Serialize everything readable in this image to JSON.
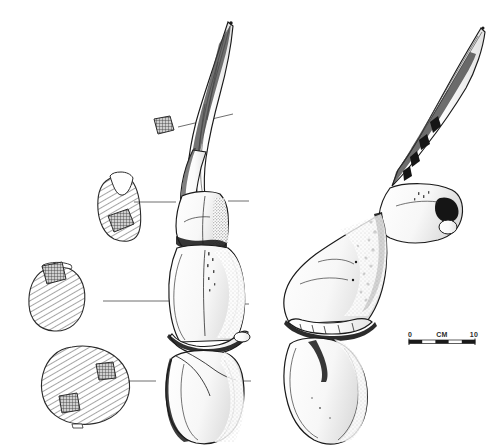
{
  "figure": {
    "type": "scientific-line-drawing",
    "background_color": "#ffffff",
    "ink_color": "#1a1a1a",
    "hatch_color": "#555555",
    "shade_color": "#888888"
  },
  "scale_bar": {
    "name": "scale-bar",
    "left_label": "0",
    "unit_label": "CM",
    "right_label": "10",
    "segments": 5,
    "bar_color": "#1a1a1a",
    "x": 409,
    "y": 339,
    "width": 66
  },
  "views": [
    {
      "id": "dorsal-view",
      "label": "dorsal view of cranium with horn core",
      "position": "center-left"
    },
    {
      "id": "lateral-view",
      "label": "lateral view of cranium with horn core",
      "position": "right"
    }
  ],
  "cross_sections": [
    {
      "id": "section-a",
      "label": "horn core distal cross-section",
      "shape": "small-square",
      "inclusions": 1,
      "leader_to": "upper horn core"
    },
    {
      "id": "section-b",
      "label": "horn core proximal cross-section",
      "shape": "notched-oval",
      "inclusions": 1,
      "leader_to": "horn core base"
    },
    {
      "id": "section-c",
      "label": "pedicle cross-section",
      "shape": "rounded-oval",
      "inclusions": 1,
      "leader_to": "mid cranium"
    },
    {
      "id": "section-d",
      "label": "basal cross-section",
      "shape": "large-oval",
      "inclusions": 2,
      "leader_to": "lower cranium"
    }
  ],
  "leader_lines": [
    {
      "id": "leader-a",
      "x1": 178,
      "y1": 126,
      "x2": 232,
      "y2": 115
    },
    {
      "id": "leader-b",
      "x1": 133,
      "y1": 202,
      "x2": 175,
      "y2": 202
    },
    {
      "id": "leader-b-right",
      "x1": 228,
      "y1": 202,
      "x2": 248,
      "y2": 202
    },
    {
      "id": "leader-c",
      "x1": 103,
      "y1": 301,
      "x2": 168,
      "y2": 301
    },
    {
      "id": "leader-c-right",
      "x1": 233,
      "y1": 303,
      "x2": 248,
      "y2": 303
    },
    {
      "id": "leader-d",
      "x1": 128,
      "y1": 381,
      "x2": 155,
      "y2": 381
    },
    {
      "id": "leader-d-right",
      "x1": 238,
      "y1": 381,
      "x2": 250,
      "y2": 381
    }
  ]
}
